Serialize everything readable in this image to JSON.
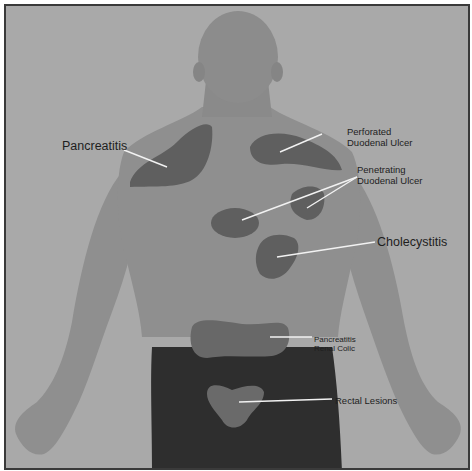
{
  "figure": {
    "labels": [
      {
        "id": "pancreatitis",
        "text": "Pancreatitis"
      },
      {
        "id": "perforated-duodenal-ulcer",
        "line1": "Perforated",
        "line2": "Duodenal Ulcer"
      },
      {
        "id": "penetrating-duodenal-ulcer",
        "line1": "Penetrating",
        "line2": "Duodenal Ulcer"
      },
      {
        "id": "cholecystitis",
        "text": "Cholecystitis"
      },
      {
        "id": "pancreatitis-renal-colic",
        "line1": "Pancreatitis",
        "line2": "Renal Colic"
      },
      {
        "id": "rectal-lesions",
        "text": "Rectal Lesions"
      }
    ],
    "colors": {
      "background": "#a9a9a9",
      "skin": "#8f8f8f",
      "skin_shadow": "#7a7a7a",
      "pain_region": "#5f5f5f",
      "pants": "#2e2e2e",
      "leader_line": "#f2f2f2",
      "border": "#3a3a3a"
    }
  }
}
